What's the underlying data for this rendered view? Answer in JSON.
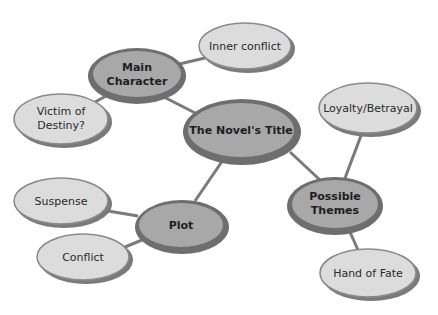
{
  "diagram": {
    "type": "concept-map",
    "colors": {
      "main_fill": "#a8a8a8",
      "main_stroke": "#6e6e6e",
      "sub_fill": "#dcdcdc",
      "sub_stroke": "#8a8a8a",
      "sub_shadow": "#7a7a7a",
      "connector": "#7a7a7a"
    },
    "center": {
      "id": "title",
      "label": "The Novel's Title"
    },
    "main_nodes": [
      {
        "id": "main-character",
        "lines": [
          "Main",
          "Character"
        ]
      },
      {
        "id": "plot",
        "lines": [
          "Plot"
        ]
      },
      {
        "id": "possible-themes",
        "lines": [
          "Possible",
          "Themes"
        ]
      }
    ],
    "sub_nodes": [
      {
        "id": "inner-conflict",
        "parent": "main-character",
        "lines": [
          "Inner conflict"
        ]
      },
      {
        "id": "victim-of-destiny",
        "parent": "main-character",
        "lines": [
          "Victim of",
          "Destiny?"
        ]
      },
      {
        "id": "suspense",
        "parent": "plot",
        "lines": [
          "Suspense"
        ]
      },
      {
        "id": "conflict",
        "parent": "plot",
        "lines": [
          "Conflict"
        ]
      },
      {
        "id": "loyalty-betrayal",
        "parent": "possible-themes",
        "lines": [
          "Loyalty/Betrayal"
        ]
      },
      {
        "id": "hand-of-fate",
        "parent": "possible-themes",
        "lines": [
          "Hand of Fate"
        ]
      }
    ]
  }
}
